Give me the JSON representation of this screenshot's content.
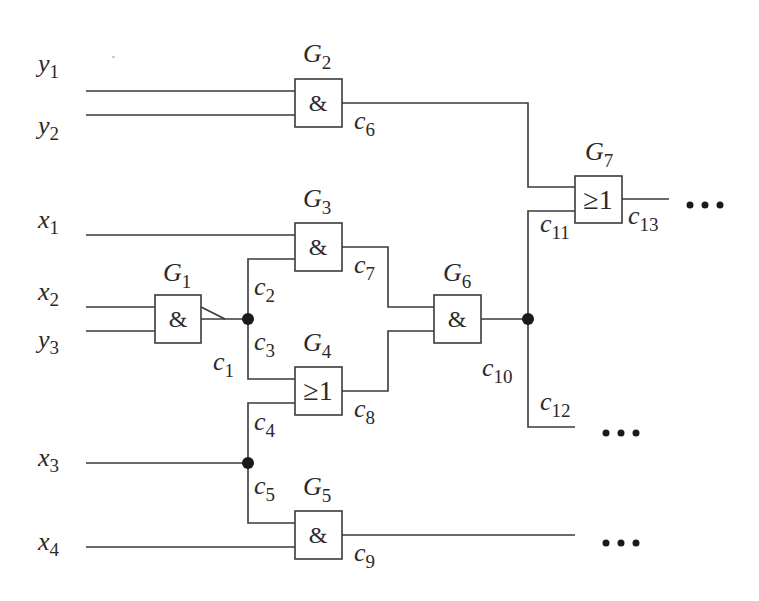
{
  "diagram": {
    "type": "logic-circuit",
    "inputs": [
      {
        "id": "y1",
        "base": "y",
        "sub": "1",
        "x": 30,
        "y": 50,
        "wire_y": 91
      },
      {
        "id": "y2",
        "base": "y",
        "sub": "2",
        "x": 30,
        "y": 136,
        "wire_y": 115
      },
      {
        "id": "x1",
        "base": "x",
        "sub": "1",
        "x": 30,
        "y": 232,
        "wire_y": 235
      },
      {
        "id": "x2",
        "base": "x",
        "sub": "2",
        "x": 30,
        "y": 305,
        "wire_y": 307
      },
      {
        "id": "y3",
        "base": "y",
        "sub": "3",
        "x": 30,
        "y": 353,
        "wire_y": 331
      },
      {
        "id": "x3",
        "base": "x",
        "sub": "3",
        "x": 30,
        "y": 472,
        "wire_y": 463
      },
      {
        "id": "x4",
        "base": "x",
        "sub": "4",
        "x": 30,
        "y": 557,
        "wire_y": 547
      }
    ],
    "gates": [
      {
        "id": "G1",
        "base": "G",
        "sub": "1",
        "symbol": "&",
        "x": 155,
        "y": 295,
        "label_x": 163,
        "label_y": 281
      },
      {
        "id": "G2",
        "base": "G",
        "sub": "2",
        "symbol": "&",
        "x": 295,
        "y": 79,
        "label_x": 303,
        "label_y": 62
      },
      {
        "id": "G3",
        "base": "G",
        "sub": "3",
        "symbol": "&",
        "x": 295,
        "y": 223,
        "label_x": 303,
        "label_y": 207
      },
      {
        "id": "G4",
        "base": "G",
        "sub": "4",
        "symbol": "≥1",
        "x": 295,
        "y": 367,
        "label_x": 303,
        "label_y": 351
      },
      {
        "id": "G5",
        "base": "G",
        "sub": "5",
        "symbol": "&",
        "x": 295,
        "y": 511,
        "label_x": 303,
        "label_y": 495
      },
      {
        "id": "G6",
        "base": "G",
        "sub": "6",
        "symbol": "&",
        "x": 434,
        "y": 295,
        "label_x": 443,
        "label_y": 281
      },
      {
        "id": "G7",
        "base": "G",
        "sub": "7",
        "symbol": "≥1",
        "x": 575,
        "y": 176,
        "label_x": 585,
        "label_y": 160
      }
    ],
    "connections": [
      {
        "id": "c1",
        "base": "c",
        "sub": "1",
        "x": 212,
        "y": 378
      },
      {
        "id": "c2",
        "base": "c",
        "sub": "2",
        "x": 254,
        "y": 298
      },
      {
        "id": "c3",
        "base": "c",
        "sub": "3",
        "x": 254,
        "y": 352
      },
      {
        "id": "c4",
        "base": "c",
        "sub": "4",
        "x": 254,
        "y": 433
      },
      {
        "id": "c5",
        "base": "c",
        "sub": "5",
        "x": 254,
        "y": 498
      },
      {
        "id": "c6",
        "base": "c",
        "sub": "6",
        "x": 354,
        "y": 131
      },
      {
        "id": "c7",
        "base": "c",
        "sub": "7",
        "x": 354,
        "y": 275
      },
      {
        "id": "c8",
        "base": "c",
        "sub": "8",
        "x": 354,
        "y": 419
      },
      {
        "id": "c9",
        "base": "c",
        "sub": "9",
        "x": 354,
        "y": 563
      },
      {
        "id": "c10",
        "base": "c",
        "sub": "10",
        "x": 482,
        "y": 378
      },
      {
        "id": "c11",
        "base": "c",
        "sub": "11",
        "x": 541,
        "y": 233
      },
      {
        "id": "c12",
        "base": "c",
        "sub": "12",
        "x": 541,
        "y": 412
      },
      {
        "id": "c13",
        "base": "c",
        "sub": "13",
        "x": 628,
        "y": 228
      }
    ],
    "junctions": [
      {
        "id": "j-c1",
        "x": 248,
        "y": 319
      },
      {
        "id": "j-x3",
        "x": 248,
        "y": 463
      },
      {
        "id": "j-c10",
        "x": 528,
        "y": 319
      }
    ],
    "continuations": [
      {
        "id": "ellipsis-c13",
        "text": "...",
        "x": 686,
        "y": 205
      },
      {
        "id": "ellipsis-c12",
        "text": "...",
        "x": 606,
        "y": 433
      },
      {
        "id": "ellipsis-c9",
        "text": "...",
        "x": 606,
        "y": 543
      }
    ]
  }
}
